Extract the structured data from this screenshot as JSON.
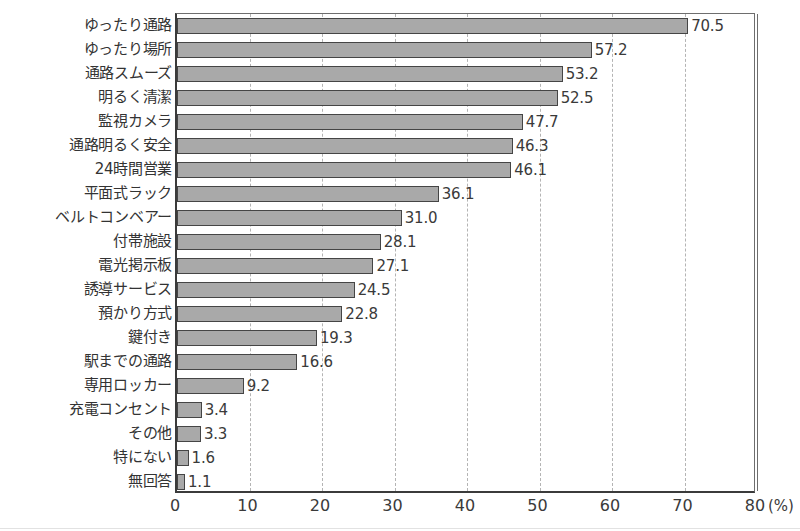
{
  "chart_data": {
    "type": "bar",
    "orientation": "horizontal",
    "title": "",
    "xlabel": "(%)",
    "ylabel": "",
    "xlim": [
      0,
      80
    ],
    "xticks": [
      0,
      10,
      20,
      30,
      40,
      50,
      60,
      70,
      80
    ],
    "xtick_labels": [
      "0",
      "10",
      "20",
      "30",
      "40",
      "50",
      "60",
      "70",
      "80"
    ],
    "unit_label": "(%)",
    "grid": "vertical-dashed",
    "legend": "none",
    "bar_fill_color": "#a9a9a9",
    "bar_border_color": "#454545",
    "axis_color": "#3b3b3b",
    "gridline_color": "#b4b4b4",
    "categories": [
      "ゆったり通路",
      "ゆったり場所",
      "通路スムーズ",
      "明るく清潔",
      "監視カメラ",
      "通路明るく安全",
      "24時間営業",
      "平面式ラック",
      "ベルトコンベアー",
      "付帯施設",
      "電光掲示板",
      "誘導サービス",
      "預かり方式",
      "鍵付き",
      "駅までの通路",
      "専用ロッカー",
      "充電コンセント",
      "その他",
      "特にない",
      "無回答"
    ],
    "values": [
      70.5,
      57.2,
      53.2,
      52.5,
      47.7,
      46.3,
      46.1,
      36.1,
      31.0,
      28.1,
      27.1,
      24.5,
      22.8,
      19.3,
      16.6,
      9.2,
      3.4,
      3.3,
      1.6,
      1.1
    ],
    "value_labels": [
      "70.5",
      "57.2",
      "53.2",
      "52.5",
      "47.7",
      "46.3",
      "46.1",
      "36.1",
      "31.0",
      "28.1",
      "27.1",
      "24.5",
      "22.8",
      "19.3",
      "16.6",
      "9.2",
      "3.4",
      "3.3",
      "1.6",
      "1.1"
    ]
  }
}
